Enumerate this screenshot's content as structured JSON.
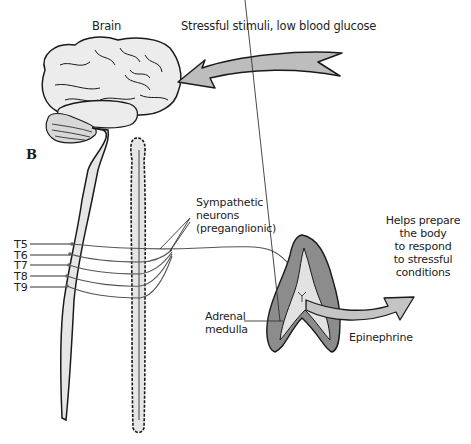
{
  "figure": {
    "panel_label": "B",
    "labels": {
      "brain": "Brain",
      "stimuli": "Stressful stimuli, low blood glucose",
      "sympathetic_line1": "Sympathetic",
      "sympathetic_line2": "neurons",
      "sympathetic_line3": "(preganglionic)",
      "adrenal_line1": "Adrenal",
      "adrenal_line2": "medulla",
      "epinephrine": "Epinephrine",
      "outcome_line1": "Helps prepare",
      "outcome_line2": "the body",
      "outcome_line3": "to respond",
      "outcome_line4": "to stressful",
      "outcome_line5": "conditions"
    },
    "spinal_segments": [
      "T5",
      "T6",
      "T7",
      "T8",
      "T9"
    ],
    "colors": {
      "outline": "#1a1a1a",
      "light_fill": "#e6e6e6",
      "mid_fill": "#bdbdbd",
      "dark_fill": "#8c8c8c",
      "nerve": "#555555"
    }
  }
}
